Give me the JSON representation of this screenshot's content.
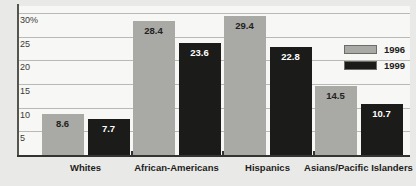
{
  "chart_data": {
    "type": "bar",
    "title": "",
    "subtitle": "",
    "xlabel": "",
    "ylabel": "",
    "categories": [
      "Whites",
      "African-Americans",
      "Hispanics",
      "Asians/Pacific Islanders"
    ],
    "series": [
      {
        "name": "1996",
        "color": "#a9a9a6",
        "values": [
          8.6,
          28.4,
          29.4,
          14.5
        ]
      },
      {
        "name": "1999",
        "color": "#1b1b19",
        "values": [
          7.7,
          23.6,
          22.8,
          10.7
        ]
      }
    ],
    "value_labels": [
      [
        "8.6",
        "28.4",
        "29.4",
        "14.5"
      ],
      [
        "7.7",
        "23.6",
        "22.8",
        "10.7"
      ]
    ],
    "ylim": [
      0,
      31.5
    ],
    "yticks": [
      5,
      10,
      15,
      20,
      25,
      30
    ],
    "ytick_labels": [
      "5",
      "10",
      "15",
      "20",
      "25",
      "30%"
    ],
    "grid": true,
    "legend_position": "right",
    "legend_entries": [
      "1996",
      "1999"
    ],
    "background_color": "#e9e9e7",
    "plot_background_color": "#f7f7f5",
    "axis_color": "#33332f",
    "gridline_color": "#b9b9b5"
  }
}
